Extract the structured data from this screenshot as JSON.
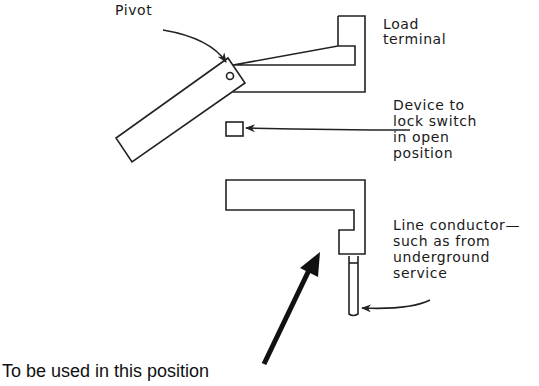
{
  "diagram": {
    "labels": {
      "pivot": "Pivot",
      "load_terminal": [
        "Load",
        "terminal"
      ],
      "lock_device": [
        "Device to",
        "lock switch",
        "in open",
        "position"
      ],
      "line_conductor": [
        "Line conductor—",
        "such as from",
        "underground",
        "service"
      ],
      "caption": "To be used in this position"
    },
    "components": [
      "pivoting-blade",
      "load-terminal",
      "lock-device",
      "line-terminal",
      "line-conductor"
    ],
    "stroke_color": "#222222"
  }
}
